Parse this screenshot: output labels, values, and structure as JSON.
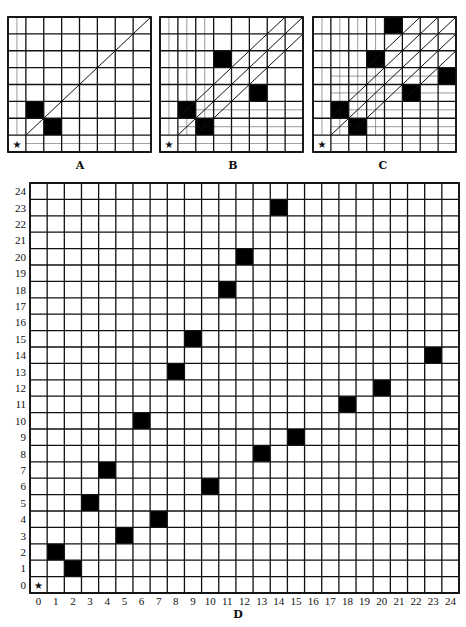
{
  "figure": {
    "colors": {
      "line": "#111111",
      "fill": "#000000",
      "background": "#ffffff"
    },
    "start_marker": "★"
  },
  "panels": [
    {
      "id": "A",
      "caption": "A",
      "box": {
        "x": 8,
        "y": 17,
        "w": 143,
        "h": 135
      },
      "size": 8,
      "black_cells": [
        [
          1,
          2
        ],
        [
          2,
          1
        ]
      ],
      "diagonals": [
        [
          1,
          1
        ]
      ],
      "caption_pos": {
        "x": 80,
        "y": 159
      }
    },
    {
      "id": "B",
      "caption": "B",
      "box": {
        "x": 160,
        "y": 17,
        "w": 143,
        "h": 135
      },
      "size": 8,
      "black_cells": [
        [
          1,
          2
        ],
        [
          2,
          1
        ],
        [
          3,
          5
        ],
        [
          5,
          3
        ]
      ],
      "diagonals": [
        [
          1,
          1
        ],
        [
          1,
          2
        ],
        [
          2,
          1
        ]
      ],
      "caption_pos": {
        "x": 233,
        "y": 159
      }
    },
    {
      "id": "C",
      "caption": "C",
      "box": {
        "x": 313,
        "y": 17,
        "w": 143,
        "h": 135
      },
      "size": 8,
      "black_cells": [
        [
          1,
          2
        ],
        [
          2,
          1
        ],
        [
          3,
          5
        ],
        [
          5,
          3
        ],
        [
          4,
          7
        ],
        [
          7,
          4
        ]
      ],
      "diagonals": [
        [
          1,
          1
        ],
        [
          1,
          2
        ],
        [
          2,
          1
        ],
        [
          3,
          5
        ],
        [
          5,
          3
        ]
      ],
      "caption_pos": {
        "x": 383,
        "y": 159
      }
    }
  ],
  "main_grid": {
    "id": "D",
    "caption": "D",
    "box": {
      "x": 30,
      "y": 183,
      "w": 429,
      "h": 410
    },
    "size": 25,
    "row_labels": [
      "24",
      "23",
      "22",
      "21",
      "20",
      "19",
      "18",
      "17",
      "16",
      "15",
      "14",
      "13",
      "12",
      "11",
      "10",
      "9",
      "8",
      "7",
      "6",
      "5",
      "4",
      "3",
      "2",
      "1",
      "0"
    ],
    "col_labels": [
      "0",
      "1",
      "2",
      "3",
      "4",
      "5",
      "6",
      "7",
      "8",
      "9",
      "10",
      "11",
      "12",
      "13",
      "14",
      "15",
      "16",
      "17",
      "18",
      "19",
      "20",
      "21",
      "22",
      "23",
      "24"
    ],
    "black_cells": [
      [
        1,
        2
      ],
      [
        2,
        1
      ],
      [
        3,
        5
      ],
      [
        5,
        3
      ],
      [
        4,
        7
      ],
      [
        7,
        4
      ],
      [
        6,
        10
      ],
      [
        10,
        6
      ],
      [
        8,
        13
      ],
      [
        13,
        8
      ],
      [
        9,
        15
      ],
      [
        15,
        9
      ],
      [
        11,
        18
      ],
      [
        18,
        11
      ],
      [
        12,
        20
      ],
      [
        20,
        12
      ],
      [
        14,
        23
      ],
      [
        23,
        14
      ]
    ],
    "caption_pos": {
      "x": 238,
      "y": 608
    }
  },
  "chart_data": {
    "type": "grid-diagram",
    "panels": {
      "A": [
        [
          1,
          2
        ],
        [
          2,
          1
        ]
      ],
      "B": [
        [
          1,
          2
        ],
        [
          2,
          1
        ],
        [
          3,
          5
        ],
        [
          5,
          3
        ]
      ],
      "C": [
        [
          1,
          2
        ],
        [
          2,
          1
        ],
        [
          3,
          5
        ],
        [
          5,
          3
        ],
        [
          4,
          7
        ],
        [
          7,
          4
        ]
      ],
      "D": [
        [
          1,
          2
        ],
        [
          2,
          1
        ],
        [
          3,
          5
        ],
        [
          5,
          3
        ],
        [
          4,
          7
        ],
        [
          7,
          4
        ],
        [
          6,
          10
        ],
        [
          10,
          6
        ],
        [
          8,
          13
        ],
        [
          13,
          8
        ],
        [
          9,
          15
        ],
        [
          15,
          9
        ],
        [
          11,
          18
        ],
        [
          18,
          11
        ],
        [
          12,
          20
        ],
        [
          20,
          12
        ],
        [
          14,
          23
        ],
        [
          23,
          14
        ]
      ]
    },
    "xlabel": "0–24",
    "ylabel": "0–24",
    "axis_range": {
      "x": [
        0,
        24
      ],
      "y": [
        0,
        24
      ]
    },
    "start": [
      0,
      0
    ]
  }
}
